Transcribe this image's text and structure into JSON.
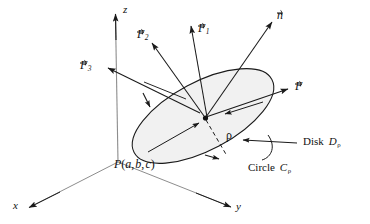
{
  "figure": {
    "type": "3d-vector-field-diagram",
    "colors": {
      "stroke": "#1a1a1a",
      "disk_fill": "#f0f0f0",
      "background": "#ffffff"
    }
  },
  "axes": {
    "x_label": "x",
    "y_label": "y",
    "z_label": "z",
    "origin": {
      "x": 118,
      "y": 162
    }
  },
  "vectors": {
    "n": {
      "symbol": "n",
      "sub": "",
      "label": "n"
    },
    "F": {
      "symbol": "F",
      "sub": "",
      "label": "F"
    },
    "F1": {
      "symbol": "F",
      "sub": "1",
      "label": "F1"
    },
    "F2": {
      "symbol": "F",
      "sub": "2",
      "label": "F2"
    },
    "F3": {
      "symbol": "F",
      "sub": "3",
      "label": "F3"
    }
  },
  "annotations": {
    "point": {
      "name": "P",
      "open": "(",
      "a": "a",
      "c1": ",",
      "b": "b",
      "c2": ",",
      "c": "c",
      "close": ")"
    },
    "radius": {
      "symbol": "ρ"
    },
    "disk": {
      "word": "Disk",
      "symbol": "D",
      "sub": "ρ"
    },
    "circle": {
      "word": "Circle",
      "symbol": "C",
      "sub": "ρ"
    }
  }
}
